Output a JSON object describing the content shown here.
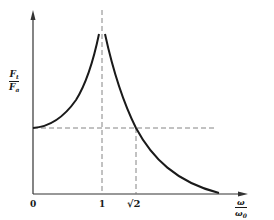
{
  "diagram": {
    "title": "",
    "y_axis": {
      "label_numerator": "F",
      "label_numerator_sub": "t",
      "label_denominator": "F",
      "label_denominator_sub": "a"
    },
    "x_axis": {
      "label_numerator": "ω",
      "label_denominator": "ω",
      "label_denominator_sub": "0",
      "ticks": [
        {
          "label": "0",
          "value": 0
        },
        {
          "label": "1",
          "value": 1
        },
        {
          "label": "√2",
          "value": 1.414
        }
      ]
    },
    "reference_lines": [
      {
        "type": "vertical-dashed",
        "at": "1",
        "meaning": "resonance"
      },
      {
        "type": "vertical-dashed",
        "at": "√2"
      },
      {
        "type": "horizontal-dashed",
        "at_ratio": 1
      }
    ],
    "curve": {
      "description": "Transmissibility ratio Ft/Fa vs frequency ratio ω/ω0; starts at 1, rises toward infinity at ω/ω0 = 1, falls back to 1 at √2, then decays toward 0",
      "stroke_color": "#1a1a1a"
    },
    "colors": {
      "axis": "#333333",
      "curve": "#1a1a1a",
      "dashed": "#666666",
      "background": "#ffffff"
    }
  }
}
